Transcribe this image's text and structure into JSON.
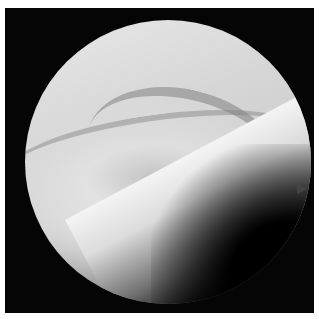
{
  "image": {
    "description": "Grayscale arthroscopic view in a circular field on black background",
    "colors": {
      "border": "#ffffff",
      "background": "#050505",
      "tissue_light": "#e8e8e8",
      "tissue_mid": "#bdbdbd",
      "shadow": "#000000"
    }
  }
}
